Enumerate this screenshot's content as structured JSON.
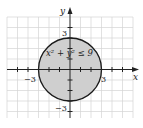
{
  "diagram": {
    "type": "inequality-region",
    "inequality": "x² + y² ≤ 9",
    "axes": {
      "x_label": "x",
      "y_label": "y",
      "ticks": [
        "3",
        "-3",
        "3",
        "-3"
      ]
    },
    "labels": {
      "x_pos": "3",
      "x_neg": "−3",
      "y_pos": "3",
      "y_neg": "−3"
    },
    "region": {
      "shape": "circle",
      "center": [
        0,
        0
      ],
      "radius": 3,
      "fill": "#cfcfcf",
      "stroke": "#1a1a1a"
    },
    "grid": {
      "x_range": [
        -6,
        6
      ],
      "y_range": [
        -5,
        5
      ],
      "color": "#d4d4d4"
    }
  }
}
